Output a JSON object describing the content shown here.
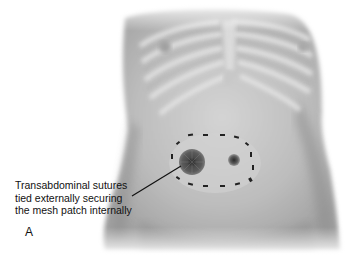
{
  "figure": {
    "panel_letter": "A",
    "callout": {
      "lines": [
        "Transabdominal sutures",
        "tied externally securing",
        "the mesh patch internally"
      ]
    },
    "colors": {
      "background": "#ffffff",
      "skin_light": "#d8d8d8",
      "skin_mid": "#b4b4b4",
      "skin_dark": "#8c8c8c",
      "suture": "#222222",
      "leader_line": "#111111"
    }
  }
}
